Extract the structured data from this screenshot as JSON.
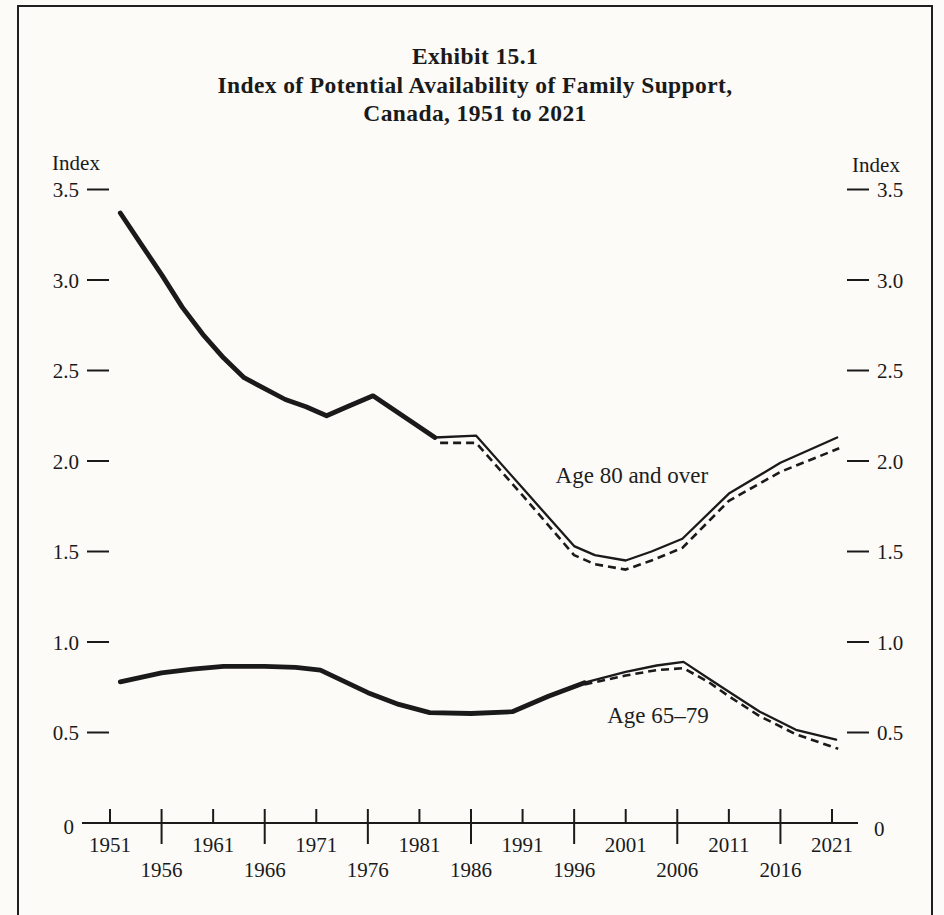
{
  "title": {
    "line1": "Exhibit 15.1",
    "line2": "Index of Potential Availability of Family Support,",
    "line3": "Canada, 1951 to 2021"
  },
  "colors": {
    "ink": "#1a1a1a",
    "background": "#fcfbf8"
  },
  "chart_data": {
    "type": "line",
    "grid": "off",
    "legend": "inline-annotations",
    "y_axis": {
      "label": "Index",
      "zero_label": "0",
      "range": [
        0,
        3.5
      ],
      "mirrored_right": true,
      "ticks": [
        {
          "label": "3.5",
          "value": 3.5
        },
        {
          "label": "3.0",
          "value": 3.0
        },
        {
          "label": "2.5",
          "value": 2.5
        },
        {
          "label": "2.0",
          "value": 2.0
        },
        {
          "label": "1.5",
          "value": 1.5
        },
        {
          "label": "1.0",
          "value": 1.0
        },
        {
          "label": "0.5",
          "value": 0.5
        }
      ]
    },
    "x_axis": {
      "range": [
        1951,
        2021
      ],
      "ticks_major": [
        {
          "label": "1951",
          "year": 1951
        },
        {
          "label": "1961",
          "year": 1961
        },
        {
          "label": "1971",
          "year": 1971
        },
        {
          "label": "1981",
          "year": 1981
        },
        {
          "label": "1991",
          "year": 1991
        },
        {
          "label": "2001",
          "year": 2001
        },
        {
          "label": "2011",
          "year": 2011
        },
        {
          "label": "2021",
          "year": 2021
        }
      ],
      "ticks_minor": [
        {
          "label": "1956",
          "year": 1956
        },
        {
          "label": "1966",
          "year": 1966
        },
        {
          "label": "1976",
          "year": 1976
        },
        {
          "label": "1986",
          "year": 1986
        },
        {
          "label": "1996",
          "year": 1996
        },
        {
          "label": "2006",
          "year": 2006
        },
        {
          "label": "2016",
          "year": 2016
        }
      ]
    },
    "series": [
      {
        "id": "age-80-observed",
        "group": "Age 80 and over",
        "style": "observed",
        "points": [
          [
            1952,
            3.37
          ],
          [
            1954,
            3.2
          ],
          [
            1956,
            3.03
          ],
          [
            1958,
            2.85
          ],
          [
            1960,
            2.7
          ],
          [
            1962,
            2.57
          ],
          [
            1964,
            2.46
          ],
          [
            1966,
            2.4
          ],
          [
            1968,
            2.34
          ],
          [
            1970,
            2.3
          ],
          [
            1972,
            2.25
          ],
          [
            1974,
            2.3
          ],
          [
            1976.5,
            2.36
          ],
          [
            1982.5,
            2.13
          ]
        ]
      },
      {
        "id": "age-80-projection-solid",
        "group": "Age 80 and over",
        "style": "projection-solid",
        "points": [
          [
            1982.5,
            2.13
          ],
          [
            1986.5,
            2.14
          ],
          [
            1991,
            1.85
          ],
          [
            1996,
            1.53
          ],
          [
            1998,
            1.48
          ],
          [
            2001,
            1.45
          ],
          [
            2003.5,
            1.5
          ],
          [
            2006.5,
            1.57
          ],
          [
            2011,
            1.82
          ],
          [
            2016,
            1.99
          ],
          [
            2021.5,
            2.13
          ]
        ]
      },
      {
        "id": "age-80-projection-dashed",
        "group": "Age 80 and over",
        "style": "projection-dashed",
        "points": [
          [
            1983,
            2.1
          ],
          [
            1986.5,
            2.1
          ],
          [
            1991,
            1.81
          ],
          [
            1996,
            1.48
          ],
          [
            1998,
            1.43
          ],
          [
            2001,
            1.4
          ],
          [
            2003.5,
            1.45
          ],
          [
            2006.5,
            1.52
          ],
          [
            2011,
            1.78
          ],
          [
            2016,
            1.94
          ],
          [
            2021.7,
            2.07
          ]
        ]
      },
      {
        "id": "age-65-79-observed",
        "group": "Age 65–79",
        "style": "observed",
        "points": [
          [
            1952,
            0.78
          ],
          [
            1956,
            0.83
          ],
          [
            1959,
            0.85
          ],
          [
            1962,
            0.865
          ],
          [
            1966,
            0.865
          ],
          [
            1969,
            0.86
          ],
          [
            1971.4,
            0.845
          ],
          [
            1976,
            0.72
          ],
          [
            1979,
            0.655
          ],
          [
            1982,
            0.61
          ],
          [
            1986,
            0.605
          ],
          [
            1990,
            0.615
          ],
          [
            1993.5,
            0.7
          ],
          [
            1997,
            0.775
          ]
        ]
      },
      {
        "id": "age-65-79-projection-solid",
        "group": "Age 65–79",
        "style": "projection-solid",
        "points": [
          [
            1997,
            0.775
          ],
          [
            2001,
            0.835
          ],
          [
            2004,
            0.87
          ],
          [
            2006.6,
            0.89
          ],
          [
            2009,
            0.8
          ],
          [
            2011,
            0.725
          ],
          [
            2014,
            0.615
          ],
          [
            2017.5,
            0.515
          ],
          [
            2021.4,
            0.46
          ]
        ]
      },
      {
        "id": "age-65-79-projection-dashed",
        "group": "Age 65–79",
        "style": "projection-dashed",
        "points": [
          [
            1997,
            0.765
          ],
          [
            2001,
            0.815
          ],
          [
            2004,
            0.845
          ],
          [
            2006.6,
            0.855
          ],
          [
            2009,
            0.78
          ],
          [
            2011,
            0.7
          ],
          [
            2014,
            0.59
          ],
          [
            2017.5,
            0.49
          ],
          [
            2021.6,
            0.41
          ]
        ]
      }
    ],
    "annotations": [
      {
        "text": "Age 80 and over",
        "year": 1994.2,
        "value": 1.88
      },
      {
        "text": "Age 65–79",
        "year": 1999.2,
        "value": 0.55
      }
    ]
  }
}
